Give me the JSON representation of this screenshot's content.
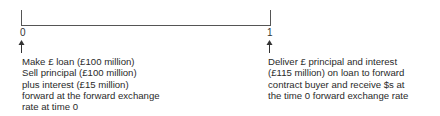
{
  "timeline": {
    "points": [
      {
        "label": "0",
        "description": [
          "Make £ loan (£100 million)",
          "Sell principal (£100 million)",
          "plus interest (£15 million)",
          "forward at the forward exchange",
          "rate at time 0"
        ]
      },
      {
        "label": "1",
        "description": [
          "Deliver £ principal and interest",
          "(£115 million) on loan to forward",
          "contract buyer and receive $s at",
          "the time 0 forward exchange rate"
        ]
      }
    ]
  }
}
